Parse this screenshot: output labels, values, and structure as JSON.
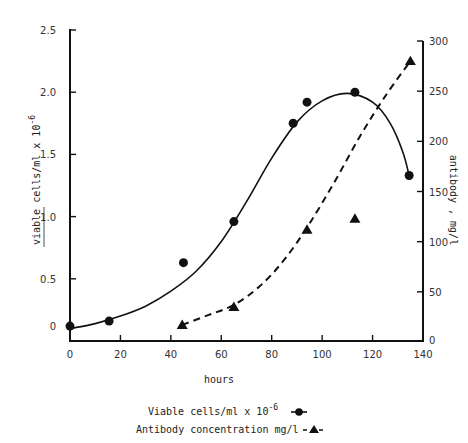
{
  "chart_data": {
    "type": "scatter",
    "title": "",
    "xlabel": "hours",
    "ylabel_left": "viable cells/ml x 10",
    "ylabel_left_sup": "-6",
    "ylabel_right": "antibody , mg/l",
    "xlim": [
      0,
      140
    ],
    "ylim_left": [
      0,
      2.5
    ],
    "ylim_right": [
      0,
      300
    ],
    "grid": false,
    "x_ticks": [
      0,
      20,
      40,
      60,
      80,
      100,
      120,
      140
    ],
    "x_tick_labels": [
      "0",
      "20",
      "40",
      "60",
      "80",
      "100",
      "120",
      "140"
    ],
    "y_left_ticks": [
      0,
      0.5,
      1.0,
      1.5,
      2.0,
      2.5
    ],
    "y_left_tick_labels": [
      "0",
      "0.5",
      "1.0",
      "1.5",
      "2.0",
      "2.5"
    ],
    "y_right_ticks": [
      0,
      50,
      100,
      150,
      200,
      250,
      300
    ],
    "y_right_tick_labels": [
      "0",
      "50",
      "100",
      "150",
      "200",
      "250",
      "300"
    ],
    "series": [
      {
        "name": "Viable cells/ml x 10^-6",
        "axis": "left",
        "marker": "circle",
        "line": "solid",
        "points": [
          {
            "x": 0,
            "y": 0.12
          },
          {
            "x": 15.5,
            "y": 0.16
          },
          {
            "x": 45,
            "y": 0.63
          },
          {
            "x": 65,
            "y": 0.96
          },
          {
            "x": 88.5,
            "y": 1.75
          },
          {
            "x": 94,
            "y": 1.92
          },
          {
            "x": 113,
            "y": 2.0
          },
          {
            "x": 134.5,
            "y": 1.33
          }
        ],
        "fit_curve": [
          [
            0,
            0.1
          ],
          [
            10,
            0.14
          ],
          [
            20,
            0.2
          ],
          [
            30,
            0.28
          ],
          [
            40,
            0.4
          ],
          [
            50,
            0.56
          ],
          [
            60,
            0.8
          ],
          [
            70,
            1.12
          ],
          [
            80,
            1.47
          ],
          [
            90,
            1.76
          ],
          [
            100,
            1.93
          ],
          [
            110,
            1.99
          ],
          [
            120,
            1.92
          ],
          [
            127,
            1.75
          ],
          [
            132,
            1.52
          ],
          [
            134.5,
            1.33
          ]
        ]
      },
      {
        "name": "Antibody concentration mg/l",
        "axis": "right",
        "marker": "triangle",
        "line": "dashed",
        "points": [
          {
            "x": 44.5,
            "y": 17
          },
          {
            "x": 65,
            "y": 35
          },
          {
            "x": 94,
            "y": 112
          },
          {
            "x": 113,
            "y": 123
          },
          {
            "x": 135,
            "y": 280
          }
        ],
        "fit_curve": [
          [
            44.5,
            17
          ],
          [
            55,
            27
          ],
          [
            65,
            37
          ],
          [
            75,
            55
          ],
          [
            85,
            82
          ],
          [
            95,
            118
          ],
          [
            105,
            160
          ],
          [
            115,
            205
          ],
          [
            125,
            245
          ],
          [
            135,
            280
          ]
        ]
      }
    ],
    "legend": {
      "placement": "bottom-center",
      "entries": [
        {
          "label": "Viable cells/ml x 10",
          "sup": "-6",
          "marker": "circle-solid-line"
        },
        {
          "label": "Antibody concentration mg/l",
          "marker": "triangle-dashed-line"
        }
      ]
    }
  }
}
